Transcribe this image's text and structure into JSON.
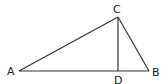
{
  "diagram": {
    "type": "triangle-with-altitude",
    "points": {
      "A": {
        "label": "A",
        "x": 19,
        "y": 71
      },
      "B": {
        "label": "B",
        "x": 149,
        "y": 71
      },
      "C": {
        "label": "C",
        "x": 118,
        "y": 17
      },
      "D": {
        "label": "D",
        "x": 118,
        "y": 71
      }
    },
    "segments": [
      "AB",
      "AC",
      "BC",
      "CD"
    ],
    "line_color": "#333333"
  }
}
